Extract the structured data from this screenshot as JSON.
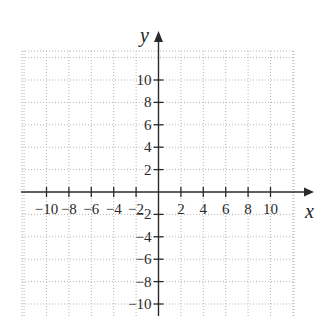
{
  "chart_data": {
    "type": "line",
    "title": "",
    "xlabel": "x",
    "ylabel": "y",
    "xlim": [
      -12,
      12
    ],
    "ylim": [
      -12,
      12
    ],
    "grid": true,
    "grid_style": "dotted",
    "grid_step": 2,
    "x_ticks": [
      -10,
      -8,
      -6,
      -4,
      -2,
      2,
      4,
      6,
      8,
      10
    ],
    "y_ticks": [
      -10,
      -8,
      -6,
      -4,
      -2,
      2,
      4,
      6,
      8,
      10
    ],
    "x_tick_labels": [
      "−10",
      "−8",
      "−6",
      "−4",
      "−2",
      "2",
      "4",
      "6",
      "8",
      "10"
    ],
    "y_tick_labels": [
      "−10",
      "−8",
      "−6",
      "−4",
      "−2",
      "2",
      "4",
      "6",
      "8",
      "10"
    ],
    "series": [],
    "legend": null
  },
  "colors": {
    "axis": "#2a2a2a",
    "grid": "#b5b5b5",
    "background": "#ffffff"
  }
}
